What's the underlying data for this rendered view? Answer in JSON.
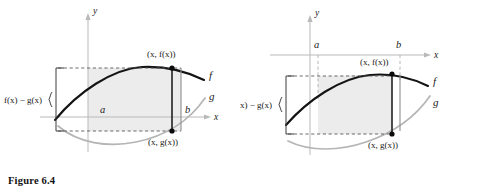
{
  "figure": {
    "caption": "Figure 6.4",
    "panels": [
      {
        "id": "left",
        "description": "Region between f and g lying above the x-axis",
        "axis_x_label": "x",
        "axis_y_label": "y",
        "curve_f_label": "f",
        "curve_g_label": "g",
        "bound_left_label": "a",
        "bound_right_label": "b",
        "point_upper_label": "(x, f(x))",
        "point_lower_label": "(x, g(x))",
        "difference_label": "f(x) − g(x)"
      },
      {
        "id": "right",
        "description": "Region between f and g lying below the x-axis",
        "axis_x_label": "x",
        "axis_y_label": "y",
        "curve_f_label": "f",
        "curve_g_label": "g",
        "bound_left_label": "a",
        "bound_right_label": "b",
        "point_upper_label": "(x, f(x))",
        "point_lower_label": "(x, g(x))",
        "difference_label": "f(x) − g(x)"
      }
    ],
    "colors": {
      "curve_f": "#141414",
      "curve_g": "#b5b5b5",
      "region_fill": "#ececec",
      "axis": "#b9b9b9",
      "background": "#ffffff"
    }
  }
}
